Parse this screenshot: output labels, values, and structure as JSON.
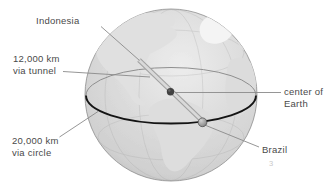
{
  "diagram": {
    "labels": {
      "indonesia": "Indonesia",
      "tunnel": {
        "line1": "12,000 km",
        "line2": "via tunnel"
      },
      "circle": {
        "line1": "20,000 km",
        "line2": "via circle"
      },
      "center": {
        "line1": "center of",
        "line2": "Earth"
      },
      "brazil": "Brazil",
      "stray_mark": "3"
    },
    "values": {
      "tunnel_distance_km": "12,000",
      "circle_distance_km": "20,000"
    },
    "colors": {
      "background": "#ffffff",
      "label_text": "#4a4a4a",
      "leader_line": "#8a8a8a",
      "globe_edge": "#8d8d8d",
      "ocean_light": "#ececec",
      "ocean_dark": "#c2c2c2",
      "limb_shadow": "rgba(0,0,0,0.30)",
      "land": "#e0e0e0",
      "greenland": "#f4f4f4",
      "equator_front": "#141414",
      "equator_back": "#8f8f8f",
      "tunnel_rod_edge": "#a2a2a2",
      "tunnel_rod_core": "#d9d9d9",
      "center_dot": "#414141",
      "brazil_dot": "#9a9a9a"
    }
  }
}
